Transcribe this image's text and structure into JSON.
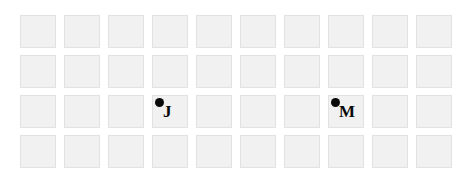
{
  "figure": {
    "type": "grid-diagram",
    "background_color": "#ffffff",
    "width": 432,
    "height": 178
  },
  "grid": {
    "columns": 10,
    "rows": 4,
    "cell_width": 36,
    "cell_height": 33,
    "col_gap": 8,
    "row_gap": 7,
    "origin_x": 20,
    "origin_y": 15,
    "cell_fill_color": "#f1f1f1",
    "cell_border_color": "#e2e2e2"
  },
  "markers": [
    {
      "label": "J",
      "row": 3,
      "column": 4,
      "dot_color": "#0a0a0a",
      "label_color": "#0a0a0a"
    },
    {
      "label": "M",
      "row": 3,
      "column": 8,
      "dot_color": "#0a0a0a",
      "label_color": "#0a0a0a"
    }
  ]
}
